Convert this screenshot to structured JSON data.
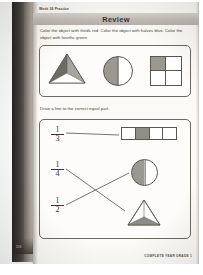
{
  "worksheet": {
    "meta_line": "Week 36 Practice",
    "banner_title": "Review",
    "footer": "COMPLETE YEAR GRADE 1",
    "page_number": "206",
    "colors": {
      "shade": "#9b9892",
      "ink": "#3a3733",
      "banner": "#c3bfb8",
      "page": "#fbfaf7",
      "binding": "#2a2724"
    }
  },
  "exercise_1": {
    "instruction": "Color the object with thirds red. Color the object with halves blue. Color the object with fourths green.",
    "shapes": [
      {
        "name": "triangle-thirds",
        "parts": 3,
        "shaded": 2,
        "label": "triangle divided into thirds"
      },
      {
        "name": "circle-halves",
        "parts": 2,
        "shaded": 1,
        "label": "circle divided into halves"
      },
      {
        "name": "square-fourths",
        "parts": 4,
        "shaded": 1,
        "label": "square divided into fourths"
      }
    ]
  },
  "exercise_2": {
    "instruction": "Draw a line to the correct equal part.",
    "fractions": [
      {
        "numerator": "1",
        "denominator": "3"
      },
      {
        "numerator": "1",
        "denominator": "4"
      },
      {
        "numerator": "1",
        "denominator": "2"
      }
    ],
    "shapes": [
      {
        "name": "rectangle-fourths",
        "parts": 4,
        "shaded": 1,
        "label": "rectangle in four equal parts"
      },
      {
        "name": "circle-halves",
        "parts": 2,
        "shaded": 1,
        "label": "circle in two equal parts"
      },
      {
        "name": "triangle-thirds",
        "parts": 3,
        "shaded": 1,
        "label": "triangle in three equal parts"
      }
    ],
    "connections": [
      {
        "from": "1/3",
        "to": "rectangle-fourths"
      },
      {
        "from": "1/4",
        "to": "triangle-thirds"
      },
      {
        "from": "1/2",
        "to": "circle-halves"
      }
    ]
  }
}
